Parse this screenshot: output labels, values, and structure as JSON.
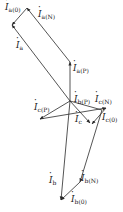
{
  "diagram": {
    "type": "phasor-diagram",
    "colors": {
      "line": "#2a2a2a",
      "background": "#ffffff"
    },
    "labels": {
      "Ia0": {
        "main": "I",
        "sub": "a(0)"
      },
      "IaN": {
        "main": "I",
        "sub": "a(N)"
      },
      "Ia": {
        "main": "I",
        "sub": "a"
      },
      "IaP": {
        "main": "I",
        "sub": "a(P)"
      },
      "IbP": {
        "main": "I",
        "sub": "b(P)"
      },
      "IcP": {
        "main": "I",
        "sub": "c(P)"
      },
      "IcN": {
        "main": "I",
        "sub": "c(N)"
      },
      "Ic": {
        "main": "I",
        "sub": "c"
      },
      "Ic0": {
        "main": "I",
        "sub": "c(0)"
      },
      "Ib": {
        "main": "I",
        "sub": "b"
      },
      "IbN": {
        "main": "I",
        "sub": "b(N)"
      },
      "Ib0": {
        "main": "I",
        "sub": "b(0)"
      }
    }
  }
}
